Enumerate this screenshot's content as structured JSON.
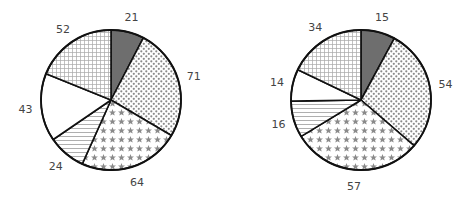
{
  "chart_data": [
    {
      "type": "pie",
      "title": "",
      "center": [
        111,
        100
      ],
      "radius": 70,
      "start_angle_deg": 0,
      "direction": "clockwise",
      "slices": [
        {
          "value": 21,
          "label": "21",
          "pattern": "solid-dark"
        },
        {
          "value": 71,
          "label": "71",
          "pattern": "dots"
        },
        {
          "value": 64,
          "label": "64",
          "pattern": "stars"
        },
        {
          "value": 24,
          "label": "24",
          "pattern": "hlines"
        },
        {
          "value": 43,
          "label": "43",
          "pattern": "blank"
        },
        {
          "value": 52,
          "label": "52",
          "pattern": "grid"
        }
      ],
      "values": [
        21,
        71,
        64,
        24,
        43,
        52
      ],
      "categories": [
        "21",
        "71",
        "64",
        "24",
        "43",
        "52"
      ]
    },
    {
      "type": "pie",
      "title": "",
      "center": [
        361,
        100
      ],
      "radius": 70,
      "start_angle_deg": 0,
      "direction": "clockwise",
      "slices": [
        {
          "value": 15,
          "label": "15",
          "pattern": "solid-dark"
        },
        {
          "value": 54,
          "label": "54",
          "pattern": "dots"
        },
        {
          "value": 57,
          "label": "57",
          "pattern": "stars"
        },
        {
          "value": 16,
          "label": "16",
          "pattern": "hlines"
        },
        {
          "value": 14,
          "label": "14",
          "pattern": "blank"
        },
        {
          "value": 34,
          "label": "34",
          "pattern": "grid"
        }
      ],
      "values": [
        15,
        54,
        57,
        16,
        14,
        34
      ],
      "categories": [
        "15",
        "54",
        "57",
        "16",
        "14",
        "34"
      ]
    }
  ],
  "colors": {
    "outline": "#111111",
    "dark_fill": "#6e6e6e",
    "pattern_ink": "#8a8a8a",
    "label_text": "#444444",
    "background": "#ffffff"
  }
}
